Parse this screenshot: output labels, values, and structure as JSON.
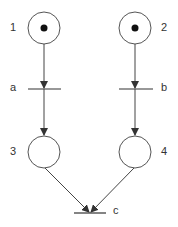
{
  "diagram": {
    "type": "petri-net",
    "places": [
      {
        "id": "1",
        "label": "1",
        "tokens": 1
      },
      {
        "id": "2",
        "label": "2",
        "tokens": 1
      },
      {
        "id": "3",
        "label": "3",
        "tokens": 0
      },
      {
        "id": "4",
        "label": "4",
        "tokens": 0
      }
    ],
    "transitions": [
      {
        "id": "a",
        "label": "a"
      },
      {
        "id": "b",
        "label": "b"
      },
      {
        "id": "c",
        "label": "c"
      }
    ],
    "arcs": [
      {
        "from": "1",
        "to": "a"
      },
      {
        "from": "a",
        "to": "3"
      },
      {
        "from": "2",
        "to": "b"
      },
      {
        "from": "b",
        "to": "4"
      },
      {
        "from": "3",
        "to": "c"
      },
      {
        "from": "4",
        "to": "c"
      }
    ],
    "colors": {
      "stroke": "#333333",
      "token": "#111111"
    }
  }
}
